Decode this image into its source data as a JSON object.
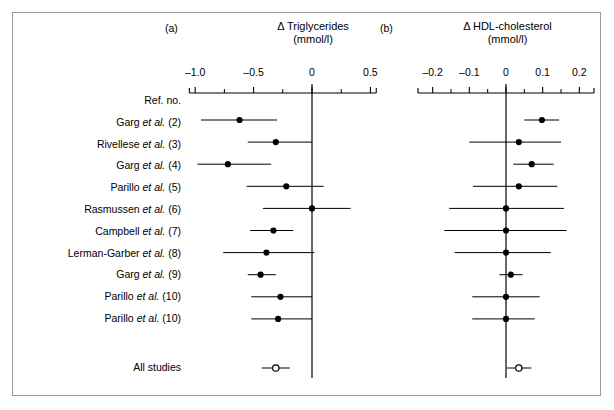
{
  "figure": {
    "width": 614,
    "height": 410,
    "background": "#ffffff",
    "frame_color": "#9a9a9a",
    "ink_color": "#000000"
  },
  "panels": {
    "a": {
      "tag": "(a)",
      "title": "Δ Triglycerides",
      "unit": "(mmol/l)"
    },
    "b": {
      "tag": "(b)",
      "title": "Δ HDL-cholesterol",
      "unit": "(mmol/l)"
    }
  },
  "row_header": "Ref. no.",
  "summary_label": "All studies",
  "study_labels": [
    "Ref. no.",
    "Garg et al. (2)",
    "Rivellese et al. (3)",
    "Garg et al. (4)",
    "Parillo et al. (5)",
    "Rasmussen et al. (6)",
    "Campbell et al. (7)",
    "Lerman-Garber et al. (8)",
    "Garg et al. (9)",
    "Parillo et al. (10)",
    "Parillo et al. (10)",
    "All studies"
  ],
  "chart_data": {
    "type": "scatter",
    "subtype": "forest-plot",
    "panels": [
      {
        "id": "a",
        "tag": "(a)",
        "title": "Δ Triglycerides",
        "ylabel": "",
        "xlabel": "(mmol/l)",
        "xlim": [
          -1.05,
          0.55
        ],
        "xticks": [
          -1.0,
          -0.5,
          0,
          0.5
        ],
        "xtick_labels": [
          "–1.0",
          "–0.5",
          "0",
          "0.5"
        ],
        "minor_ticks": [
          -0.75,
          -0.25,
          0.25
        ],
        "null_line": 0,
        "grid": false,
        "rows": [
          {
            "study": "Garg et al. (2)",
            "estimate": -0.62,
            "ci_low": -0.95,
            "ci_high": -0.3
          },
          {
            "study": "Rivellese et al. (3)",
            "estimate": -0.31,
            "ci_low": -0.55,
            "ci_high": 0.0
          },
          {
            "study": "Garg et al. (4)",
            "estimate": -0.72,
            "ci_low": -0.98,
            "ci_high": -0.35
          },
          {
            "study": "Parillo et al. (5)",
            "estimate": -0.22,
            "ci_low": -0.56,
            "ci_high": 0.1
          },
          {
            "study": "Rasmussen et al. (6)",
            "estimate": 0.0,
            "ci_low": -0.42,
            "ci_high": 0.33
          },
          {
            "study": "Campbell et al. (7)",
            "estimate": -0.33,
            "ci_low": -0.53,
            "ci_high": -0.16
          },
          {
            "study": "Lerman-Garber et al. (8)",
            "estimate": -0.39,
            "ci_low": -0.76,
            "ci_high": 0.02
          },
          {
            "study": "Garg et al. (9)",
            "estimate": -0.44,
            "ci_low": -0.55,
            "ci_high": -0.31
          },
          {
            "study": "Parillo et al. (10)",
            "estimate": -0.27,
            "ci_low": -0.52,
            "ci_high": 0.0
          },
          {
            "study": "Parillo et al. (10)",
            "estimate": -0.29,
            "ci_low": -0.52,
            "ci_high": 0.0
          }
        ],
        "summary": {
          "study": "All studies",
          "estimate": -0.31,
          "ci_low": -0.37,
          "ci_high": -0.25,
          "marker": "open-circle"
        }
      },
      {
        "id": "b",
        "tag": "(b)",
        "title": "Δ HDL-cholesterol",
        "ylabel": "",
        "xlabel": "(mmol/l)",
        "xlim": [
          -0.24,
          0.24
        ],
        "xticks": [
          -0.2,
          -0.1,
          0,
          0.1,
          0.2
        ],
        "xtick_labels": [
          "–0.2",
          "–0.1",
          "0",
          "0.1",
          "0.2"
        ],
        "minor_ticks": [
          -0.15,
          -0.05,
          0.05,
          0.15
        ],
        "null_line": 0,
        "grid": false,
        "rows": [
          {
            "study": "Garg et al. (2)",
            "estimate": 0.098,
            "ci_low": 0.05,
            "ci_high": 0.145
          },
          {
            "study": "Rivellese et al. (3)",
            "estimate": 0.035,
            "ci_low": -0.1,
            "ci_high": 0.15
          },
          {
            "study": "Garg et al. (4)",
            "estimate": 0.07,
            "ci_low": 0.02,
            "ci_high": 0.13
          },
          {
            "study": "Parillo et al. (5)",
            "estimate": 0.035,
            "ci_low": -0.09,
            "ci_high": 0.14
          },
          {
            "study": "Rasmussen et al. (6)",
            "estimate": 0.0,
            "ci_low": -0.155,
            "ci_high": 0.158
          },
          {
            "study": "Campbell et al. (7)",
            "estimate": 0.0,
            "ci_low": -0.168,
            "ci_high": 0.165
          },
          {
            "study": "Lerman-Garber et al. (8)",
            "estimate": 0.0,
            "ci_low": -0.14,
            "ci_high": 0.122
          },
          {
            "study": "Garg et al. (9)",
            "estimate": 0.013,
            "ci_low": -0.018,
            "ci_high": 0.045
          },
          {
            "study": "Parillo et al. (10)",
            "estimate": 0.0,
            "ci_low": -0.092,
            "ci_high": 0.092
          },
          {
            "study": "Parillo et al. (10)",
            "estimate": 0.0,
            "ci_low": -0.092,
            "ci_high": 0.078
          }
        ],
        "summary": {
          "study": "All studies",
          "estimate": 0.035,
          "ci_low": 0.022,
          "ci_high": 0.05,
          "marker": "open-circle"
        }
      }
    ]
  },
  "geometry": {
    "label_right_x": 181,
    "label_first_y": 101,
    "row_pitch": 21.8,
    "summary_label_y": 368,
    "axis_a": {
      "x_left": 196,
      "x_right": 383,
      "x_zero": 312,
      "units_per_px": 0.00856,
      "axis_y": 93
    },
    "axis_b": {
      "x_left": 418,
      "x_right": 594,
      "x_zero": 506,
      "units_per_px": 0.002727,
      "axis_y": 93
    },
    "data_first_y": 120,
    "data_row_pitch": 22.1,
    "summary_y": 368,
    "null_line_top": 84,
    "null_line_bottom": 378
  }
}
